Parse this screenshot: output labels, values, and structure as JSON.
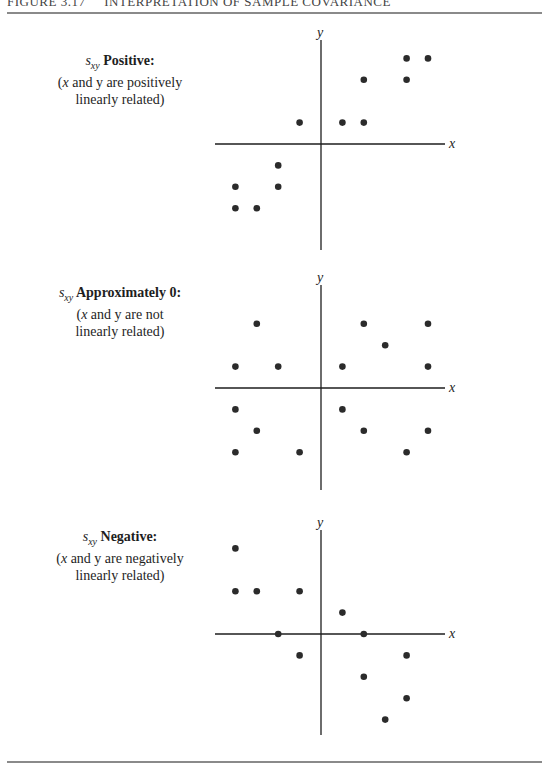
{
  "header": {
    "figure_number": "FIGURE 3.17",
    "figure_title": "INTERPRETATION OF SAMPLE COVARIANCE"
  },
  "chart_data": [
    {
      "type": "scatter",
      "title": "s_xy Positive:",
      "subtitle": "(x and y are positively linearly related)",
      "xlabel": "x",
      "ylabel": "y",
      "grid": false,
      "points": [
        [
          -1,
          1
        ],
        [
          1,
          1
        ],
        [
          2,
          1
        ],
        [
          2,
          3
        ],
        [
          4,
          3
        ],
        [
          4,
          4
        ],
        [
          5,
          4
        ],
        [
          -2,
          -1
        ],
        [
          -4,
          -2
        ],
        [
          -2,
          -2
        ],
        [
          -4,
          -3
        ],
        [
          -3,
          -3
        ]
      ]
    },
    {
      "type": "scatter",
      "title": "s_xy Approximately 0:",
      "subtitle": "(x and y are not linearly related)",
      "xlabel": "x",
      "ylabel": "y",
      "grid": false,
      "points": [
        [
          -3,
          3
        ],
        [
          2,
          3
        ],
        [
          5,
          3
        ],
        [
          3,
          2
        ],
        [
          -4,
          1
        ],
        [
          -2,
          1
        ],
        [
          1,
          1
        ],
        [
          5,
          1
        ],
        [
          -4,
          -1
        ],
        [
          1,
          -1
        ],
        [
          -3,
          -2
        ],
        [
          2,
          -2
        ],
        [
          5,
          -2
        ],
        [
          -4,
          -3
        ],
        [
          -1,
          -3
        ],
        [
          4,
          -3
        ]
      ]
    },
    {
      "type": "scatter",
      "title": "s_xy Negative:",
      "subtitle": "(x and y are negatively linearly related)",
      "xlabel": "x",
      "ylabel": "y",
      "grid": false,
      "points": [
        [
          -4,
          4
        ],
        [
          -4,
          2
        ],
        [
          -3,
          2
        ],
        [
          -1,
          2
        ],
        [
          1,
          1
        ],
        [
          -2,
          0
        ],
        [
          2,
          0
        ],
        [
          -1,
          -1
        ],
        [
          4,
          -1
        ],
        [
          2,
          -2
        ],
        [
          4,
          -3
        ],
        [
          3,
          -4
        ]
      ]
    }
  ],
  "panels": [
    {
      "symbol": "s",
      "subscript": "xy",
      "title": "Positive:",
      "desc_pre": "(",
      "desc_var1": "x",
      "desc_mid": " and y are positively",
      "desc_line2": "linearly related)"
    },
    {
      "symbol": "s",
      "subscript": "xy",
      "title": "Approximately 0:",
      "desc_pre": "(",
      "desc_var1": "x",
      "desc_mid": " and y are not",
      "desc_line2": "linearly related)"
    },
    {
      "symbol": "s",
      "subscript": "xy",
      "title": "Negative:",
      "desc_pre": "(",
      "desc_var1": "x",
      "desc_mid": " and y are negatively",
      "desc_line2": "linearly related)"
    }
  ],
  "axis_labels": {
    "x": "x",
    "y": "y"
  },
  "colors": {
    "dot": "#2b2b2b",
    "axis": "#1e1e1e",
    "rule": "#8a8a8a"
  }
}
